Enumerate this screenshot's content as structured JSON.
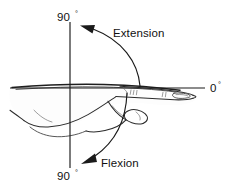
{
  "diagram": {
    "background_color": "#ffffff",
    "ink_color": "#1a1a1a",
    "axes": {
      "vertical": {
        "name": "vertical-axis",
        "x": 70,
        "y_top": 22,
        "y_bottom": 168
      },
      "horizontal": {
        "name": "horizontal-axis",
        "y": 88,
        "x_left": 10,
        "x_right": 205
      }
    },
    "labels": {
      "top_angle": "90",
      "top_angle_degree": "°",
      "bottom_angle": "90",
      "bottom_angle_degree": "°",
      "right_angle": "0",
      "right_angle_degree": "°",
      "extension": "Extension",
      "flexion": "Flexion"
    },
    "arrows": [
      {
        "name": "extension-arrow",
        "label": "Extension",
        "direction": "upward-counterclockwise",
        "points_to": "90 degrees above neutral"
      },
      {
        "name": "flexion-arrow",
        "label": "Flexion",
        "direction": "downward-clockwise",
        "points_to": "90 degrees below neutral"
      }
    ],
    "subject": {
      "name": "hand-illustration",
      "view": "lateral side profile",
      "parts": [
        "forearm",
        "wrist",
        "palm",
        "thumb",
        "index-finger",
        "fingernail",
        "knuckle-creases"
      ]
    }
  }
}
